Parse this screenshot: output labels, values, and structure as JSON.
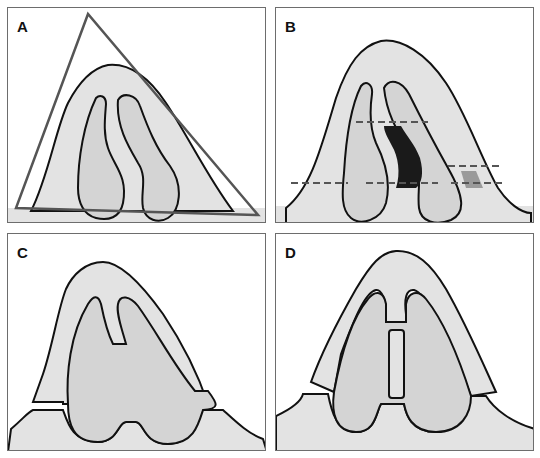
{
  "figure": {
    "panels": [
      {
        "id": "A",
        "label": "A",
        "description": "Nasal cross-section with triangular outline"
      },
      {
        "id": "B",
        "label": "B",
        "description": "Nasal cross-section with dashed measurement lines and shaded septal/valve regions"
      },
      {
        "id": "C",
        "label": "C",
        "description": "Cross-section with cartilage separated from base"
      },
      {
        "id": "D",
        "label": "D",
        "description": "Cross-section with central septal strut graft"
      }
    ],
    "colors": {
      "background": "#ffffff",
      "tissue_light": "#e3e3e3",
      "tissue_inner": "#d4d4d4",
      "outline": "#111111",
      "triangle": "#555555",
      "dark_region": "#1a1a1a",
      "mid_region": "#9a9a9a",
      "border": "#6d6d6d"
    }
  }
}
